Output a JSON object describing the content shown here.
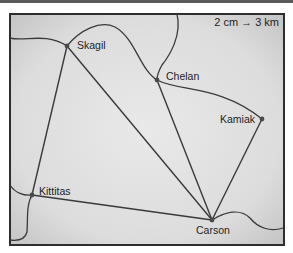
{
  "scale": {
    "label": "2 cm → 3 km"
  },
  "colors": {
    "background": "#dcdcdc",
    "line": "#3a3a3a",
    "text": "#1e1e1e"
  },
  "towns": [
    {
      "name": "Skagil",
      "x": 67,
      "y": 46
    },
    {
      "name": "Chelan",
      "x": 157,
      "y": 80
    },
    {
      "name": "Kamiak",
      "x": 262,
      "y": 119
    },
    {
      "name": "Kittitas",
      "x": 32,
      "y": 195
    },
    {
      "name": "Carson",
      "x": 212,
      "y": 220
    }
  ],
  "roads": [
    [
      "Skagil",
      "Kittitas"
    ],
    [
      "Skagil",
      "Carson"
    ],
    [
      "Chelan",
      "Carson"
    ],
    [
      "Kamiak",
      "Carson"
    ],
    [
      "Kittitas",
      "Carson"
    ]
  ]
}
